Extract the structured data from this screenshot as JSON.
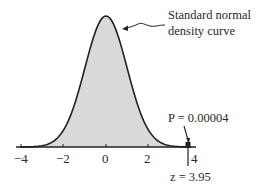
{
  "chart_data": {
    "type": "area",
    "title": "",
    "xlabel": "",
    "ylabel": "",
    "xlim": [
      -4,
      4
    ],
    "x_ticks": [
      -4,
      -2,
      0,
      2,
      4
    ],
    "x_tick_labels": [
      "−4",
      "−2",
      "0",
      "2",
      "4"
    ],
    "series": [
      {
        "name": "Standard normal density curve",
        "x": [
          -4,
          -3.5,
          -3,
          -2.5,
          -2,
          -1.5,
          -1,
          -0.5,
          0,
          0.5,
          1,
          1.5,
          2,
          2.5,
          3,
          3.5,
          4
        ],
        "values": [
          0.0001,
          0.0009,
          0.0044,
          0.0175,
          0.054,
          0.1295,
          0.242,
          0.3521,
          0.3989,
          0.3521,
          0.242,
          0.1295,
          0.054,
          0.0175,
          0.0044,
          0.0009,
          0.0001
        ]
      }
    ],
    "annotations": [
      {
        "text": "Standard normal density curve",
        "points_to": "curve"
      },
      {
        "text": "P = 0.00004",
        "points_to": "tail beyond z = 3.95"
      },
      {
        "text": "z = 3.95",
        "x": 3.95
      }
    ],
    "grid": false,
    "legend": "none"
  },
  "labels": {
    "curve_label_line1": "Standard normal",
    "curve_label_line2": "density curve",
    "p_value": "P = 0.00004",
    "z_value": "z = 3.95",
    "tick_m4": "−4",
    "tick_m2": "−2",
    "tick_0": "0",
    "tick_2": "2",
    "tick_4": "4"
  },
  "colors": {
    "fill": "#d9d9d9",
    "stroke": "#222222"
  }
}
